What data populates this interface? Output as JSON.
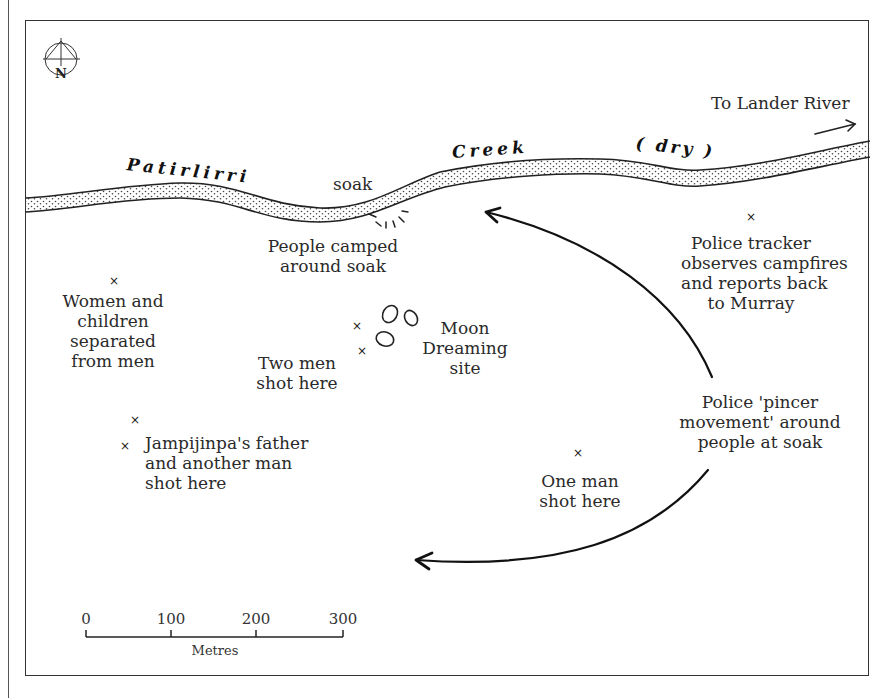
{
  "map": {
    "north_label": "N",
    "creek": {
      "name_part1": "Patirlirri",
      "name_part2": "Creek",
      "name_part3": "( dry )"
    },
    "direction_label": "To Lander River",
    "labels": {
      "soak": "soak",
      "camp": [
        "People camped",
        "around soak"
      ],
      "women": [
        "Women and",
        "children",
        "separated",
        "from men"
      ],
      "two_men": [
        "Two men",
        "shot here"
      ],
      "moon": [
        "Moon",
        "Dreaming",
        "site"
      ],
      "jampijinpa": [
        "Jampijinpa's father",
        "and another man",
        "shot here"
      ],
      "tracker": [
        "Police tracker",
        "observes campfires",
        "and reports back",
        "to Murray"
      ],
      "pincer": [
        "Police 'pincer",
        "movement' around",
        "people at soak"
      ],
      "one_man": [
        "One man",
        "shot here"
      ]
    },
    "markers": [
      {
        "id": "women",
        "symbol": "×",
        "x": 113,
        "y": 281
      },
      {
        "id": "two-men-a",
        "symbol": "×",
        "x": 356,
        "y": 326
      },
      {
        "id": "two-men-b",
        "symbol": "×",
        "x": 361,
        "y": 351
      },
      {
        "id": "jampijinpa-a",
        "symbol": "×",
        "x": 134,
        "y": 420
      },
      {
        "id": "jampijinpa-b",
        "symbol": "×",
        "x": 124,
        "y": 446
      },
      {
        "id": "tracker",
        "symbol": "×",
        "x": 750,
        "y": 217
      },
      {
        "id": "one-man",
        "symbol": "×",
        "x": 577,
        "y": 453
      }
    ],
    "scale": {
      "ticks": [
        "0",
        "100",
        "200",
        "300"
      ],
      "unit": "Metres"
    }
  }
}
